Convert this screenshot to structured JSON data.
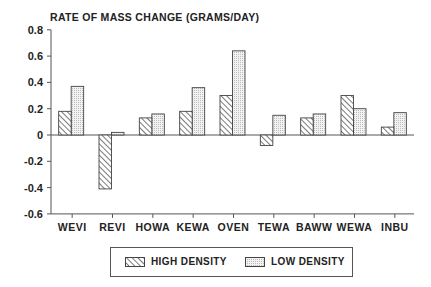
{
  "chart_data": {
    "type": "bar",
    "title": "RATE OF MASS CHANGE (GRAMS/DAY)",
    "xlabel": "",
    "ylabel": "RATE OF MASS CHANGE (GRAMS/DAY)",
    "ylim": [
      -0.6,
      0.8
    ],
    "yticks": [
      0.8,
      0.6,
      0.4,
      0.2,
      0,
      -0.2,
      -0.4,
      -0.6
    ],
    "ytick_labels": [
      "0.8",
      "0.6",
      "0.4",
      "0.2",
      "0",
      "-0.2",
      "-0.4",
      "-0.6"
    ],
    "categories": [
      "WEVI",
      "REVI",
      "HOWA",
      "KEWA",
      "OVEN",
      "TEWA",
      "BAWW",
      "WEWA",
      "INBU"
    ],
    "series": [
      {
        "name": "HIGH DENSITY",
        "pattern": "diagonal-hatch",
        "values": [
          0.18,
          -0.41,
          0.13,
          0.18,
          0.3,
          -0.08,
          0.13,
          0.3,
          0.06
        ]
      },
      {
        "name": "LOW DENSITY",
        "pattern": "fine-stipple",
        "values": [
          0.37,
          0.02,
          0.16,
          0.36,
          0.64,
          0.15,
          0.16,
          0.2,
          0.17
        ]
      }
    ],
    "grid": false,
    "legend_position": "bottom-center"
  },
  "legend": {
    "high_label": "HIGH DENSITY",
    "low_label": "LOW DENSITY"
  },
  "colors": {
    "axis": "#555555",
    "bar_outline": "#444444",
    "hatch": "#333333",
    "stipple_bg": "#e6e6e6",
    "text": "#222222"
  }
}
